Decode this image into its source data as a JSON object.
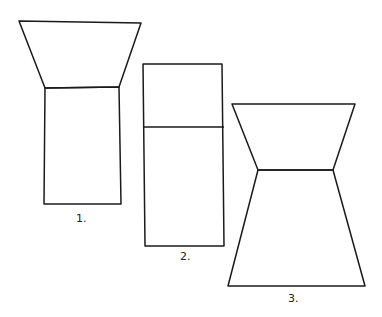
{
  "figures": [
    {
      "label": "1.",
      "description": "Inverted trapezoid on top of rectangle"
    },
    {
      "label": "2.",
      "description": "Tall rectangle divided by horizontal line"
    },
    {
      "label": "3.",
      "description": "Inverted trapezoid on top of upright trapezoid"
    }
  ],
  "stroke_color": "#1a1a1a"
}
